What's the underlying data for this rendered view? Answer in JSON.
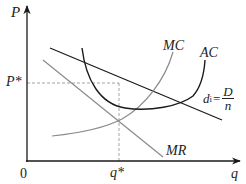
{
  "diagram": {
    "axes": {
      "y_label": "P",
      "x_label": "q",
      "origin_label": "0"
    },
    "equilibrium": {
      "price_label": "P*",
      "quantity_label": "q*"
    },
    "curves": {
      "mc": {
        "label": "MC",
        "color": "#8a8a8a"
      },
      "ac": {
        "label": "AC",
        "color": "#1a1a1a"
      },
      "mr": {
        "label": "MR",
        "color": "#8a8a8a"
      },
      "demand": {
        "label_main": "d",
        "label_sub": "i",
        "equals": "=",
        "numerator": "D",
        "denominator": "n",
        "color": "#1a1a1a"
      }
    },
    "colors": {
      "axis": "#1a1a1a",
      "dashed": "#8a8a8a",
      "text": "#222222"
    }
  }
}
